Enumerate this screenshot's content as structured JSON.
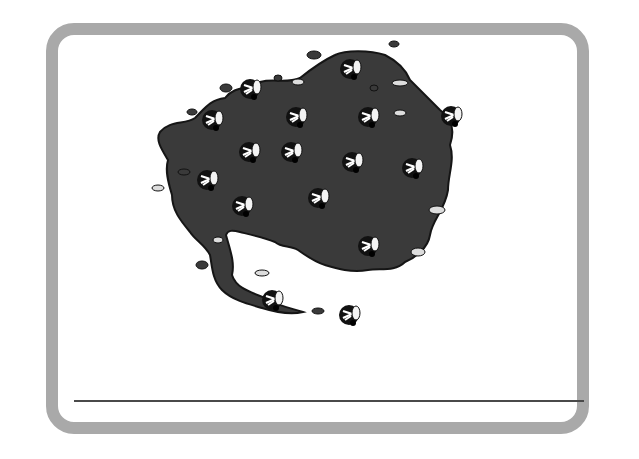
{
  "card": {
    "border_color": "#a9a9a9",
    "background": "#ffffff"
  },
  "illustration": {
    "subject": "swarm of flies",
    "swarm_color": "#3a3a3a",
    "outline_color": "#111111",
    "fly_count": 18
  },
  "answer_line": {
    "color": "#4a4a4a",
    "value": ""
  }
}
